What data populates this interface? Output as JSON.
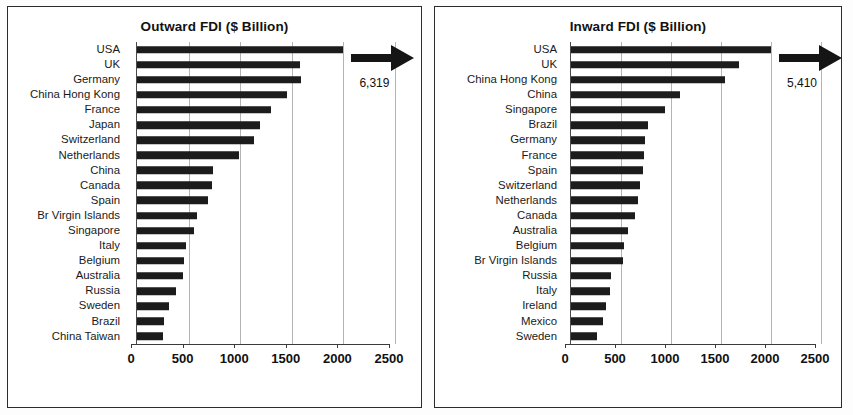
{
  "charts": [
    {
      "id": "outward",
      "title": "Outward FDI ($ Billion)",
      "overflow_label": "6,319",
      "chart_geometry": {
        "label_width": 112,
        "plot_width": 258,
        "left_pad": 11
      }
    },
    {
      "id": "inward",
      "title": "Inward FDI ($ Billion)",
      "overflow_label": "5,410",
      "chart_geometry": {
        "label_width": 122,
        "plot_width": 250,
        "left_pad": 8
      }
    }
  ],
  "chart_data": [
    {
      "type": "bar",
      "orientation": "horizontal",
      "title": "Outward FDI ($ Billion)",
      "xlabel": "",
      "ylabel": "",
      "xlim": [
        0,
        2500
      ],
      "ticks": [
        0,
        500,
        1000,
        1500,
        2000,
        2500
      ],
      "tick_labels": [
        "0",
        "500",
        "1000",
        "1500",
        "2000",
        "2500"
      ],
      "grid": true,
      "legend": false,
      "annotations": [
        {
          "text": "6,319",
          "note": "USA bar truncated at 2000; arrow indicates value extends off-scale"
        }
      ],
      "categories": [
        "USA",
        "UK",
        "Germany",
        "China Hong Kong",
        "France",
        "Japan",
        "Switzerland",
        "Netherlands",
        "China",
        "Canada",
        "Spain",
        "Br Virgin Islands",
        "Singapore",
        "Italy",
        "Belgium",
        "Australia",
        "Russia",
        "Sweden",
        "Brazil",
        "China Taiwan"
      ],
      "values": [
        6319,
        1580,
        1590,
        1450,
        1300,
        1190,
        1130,
        990,
        740,
        730,
        690,
        580,
        550,
        470,
        460,
        450,
        380,
        310,
        260,
        250
      ],
      "plotted_values": [
        2000,
        1580,
        1590,
        1450,
        1300,
        1190,
        1130,
        990,
        740,
        730,
        690,
        580,
        550,
        470,
        460,
        450,
        380,
        310,
        260,
        250
      ]
    },
    {
      "type": "bar",
      "orientation": "horizontal",
      "title": "Inward FDI ($ Billion)",
      "xlabel": "",
      "ylabel": "",
      "xlim": [
        0,
        2500
      ],
      "ticks": [
        0,
        500,
        1000,
        1500,
        2000,
        2500
      ],
      "tick_labels": [
        "0",
        "500",
        "1000",
        "1500",
        "2000",
        "2500"
      ],
      "grid": true,
      "legend": false,
      "annotations": [
        {
          "text": "5,410",
          "note": "USA bar truncated at 2000; arrow indicates value extends off-scale"
        }
      ],
      "categories": [
        "USA",
        "UK",
        "China Hong Kong",
        "China",
        "Singapore",
        "Brazil",
        "Germany",
        "France",
        "Spain",
        "Switzerland",
        "Netherlands",
        "Canada",
        "Australia",
        "Belgium",
        "Br Virgin Islands",
        "Russia",
        "Italy",
        "Ireland",
        "Mexico",
        "Sweden"
      ],
      "values": [
        5410,
        1680,
        1540,
        1090,
        940,
        770,
        740,
        730,
        720,
        690,
        670,
        640,
        570,
        530,
        520,
        400,
        390,
        350,
        320,
        260
      ],
      "plotted_values": [
        2000,
        1680,
        1540,
        1090,
        940,
        770,
        740,
        730,
        720,
        690,
        670,
        640,
        570,
        530,
        520,
        400,
        390,
        350,
        320,
        260
      ]
    }
  ]
}
